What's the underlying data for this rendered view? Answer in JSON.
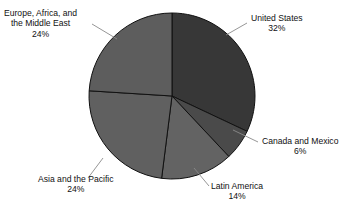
{
  "chart_data": {
    "type": "pie",
    "title": "",
    "subtitle": "",
    "xlabel": "",
    "ylabel": "",
    "legend_position": "none",
    "grid": false,
    "units": "percent",
    "start_angle_deg": 0,
    "direction": "clockwise",
    "categories": [
      "United States",
      "Canada and Mexico",
      "Latin America",
      "Asia and the Pacific",
      "Europe, Africa, and the Middle East"
    ],
    "values": [
      32,
      6,
      14,
      24,
      24
    ],
    "value_labels": [
      "32%",
      "6%",
      "14%",
      "24%",
      "24%"
    ],
    "colors": [
      "#373737",
      "#4a4a4a",
      "#636363",
      "#606060",
      "#5d5d5d"
    ],
    "slices": [
      {
        "name": "United States",
        "value": 32,
        "value_label": "32%",
        "color": "#373737",
        "start_deg": 0,
        "end_deg": 115.2
      },
      {
        "name": "Canada and Mexico",
        "value": 6,
        "value_label": "6%",
        "color": "#4a4a4a",
        "start_deg": 115.2,
        "end_deg": 136.8
      },
      {
        "name": "Latin America",
        "value": 14,
        "value_label": "14%",
        "color": "#636363",
        "start_deg": 136.8,
        "end_deg": 187.2
      },
      {
        "name": "Asia and the Pacific",
        "value": 24,
        "value_label": "24%",
        "color": "#606060",
        "start_deg": 187.2,
        "end_deg": 273.6
      },
      {
        "name": "Europe, Africa, and the Middle East",
        "value": 24,
        "value_label": "24%",
        "color": "#5d5d5d",
        "start_deg": 273.6,
        "end_deg": 360
      }
    ]
  },
  "labels": {
    "europe": {
      "line1": "Europe, Africa, and",
      "line2": "the Middle East",
      "value": "24%"
    },
    "united_states": {
      "line1": "United States",
      "value": "32%"
    },
    "canada": {
      "line1": "Canada and Mexico",
      "value": "6%"
    },
    "latin": {
      "line1": "Latin America",
      "value": "14%"
    },
    "asia": {
      "line1": "Asia and the Pacific",
      "value": "24%"
    }
  },
  "style": {
    "background": "#ffffff",
    "slice_border": "#111111",
    "leader_line": "#8a8a8a",
    "text": "#111111"
  }
}
